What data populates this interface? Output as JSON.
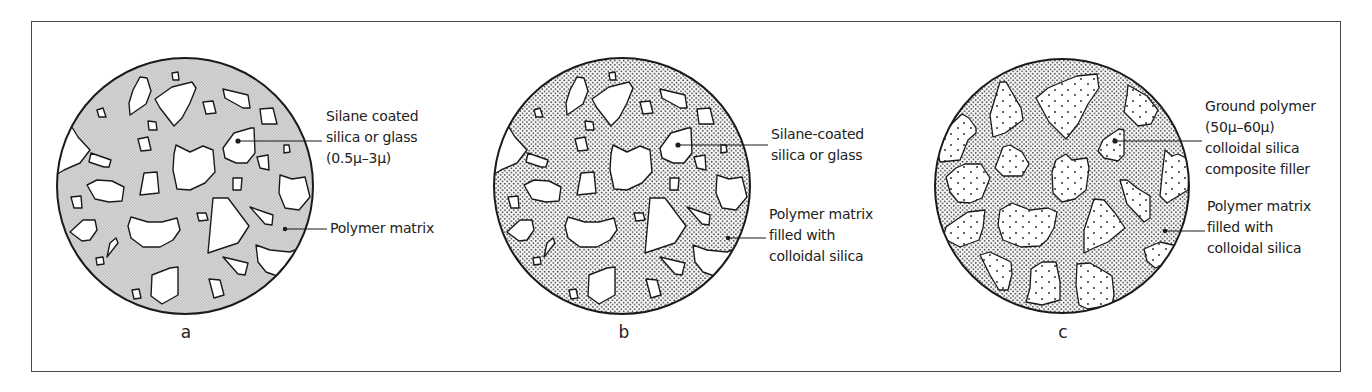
{
  "figure": {
    "panels": [
      {
        "id": "a",
        "letter": "a",
        "fill": "fine-grey-mesh",
        "callouts": [
          {
            "lines": [
              "Silane coated",
              "silica or glass",
              "(0.5μ–3μ)"
            ]
          },
          {
            "lines": [
              "Polymer matrix"
            ]
          }
        ]
      },
      {
        "id": "b",
        "letter": "b",
        "fill": "dotted",
        "callouts": [
          {
            "lines": [
              "Silane-coated",
              "silica or glass"
            ]
          },
          {
            "lines": [
              "Polymer matrix",
              "filled with",
              "colloidal silica"
            ]
          }
        ]
      },
      {
        "id": "c",
        "letter": "c",
        "fill": "dotted",
        "callouts": [
          {
            "lines": [
              "Ground polymer",
              "(50μ–60μ)",
              "colloidal silica",
              "composite filler"
            ]
          },
          {
            "lines": [
              "Polymer matrix",
              "filled with",
              "colloidal silica"
            ]
          }
        ]
      }
    ],
    "colors": {
      "stroke": "#1a1a1a",
      "mesh": "#c9c9c9",
      "dots": "#3a3a3a",
      "frame": "#4a4a4a"
    }
  }
}
